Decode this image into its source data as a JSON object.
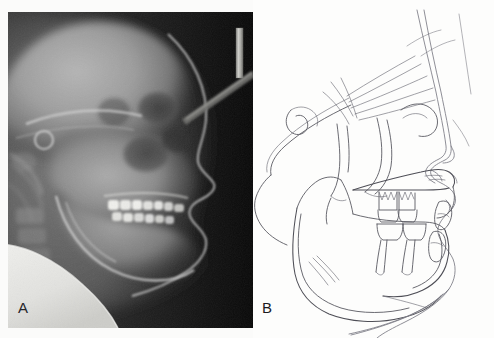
{
  "figure": {
    "panels": [
      {
        "letter": "A",
        "kind": "lateral-cephalometric-radiograph",
        "description": "Lateral cephalometric radiograph of the skull in profile"
      },
      {
        "letter": "B",
        "kind": "cephalometric-tracing",
        "description": "Hand-drawn cephalometric tracing of the same radiograph"
      }
    ]
  },
  "radiograph": {
    "background_color": "#0b0b0b",
    "bone_color": "#9a9a9a",
    "soft_tissue_color": "#5d5d5d",
    "enamel_color": "#f2f2f0",
    "shoulder_color": "#e9e9e6",
    "marker_color": "#cfcfcb",
    "structures": [
      "cranial vault",
      "frontal sinus",
      "orbit",
      "sella turcica",
      "maxillary sinus",
      "nasal cavity",
      "hard palate",
      "maxillary dentition",
      "mandibular dentition",
      "mandibular body",
      "mandibular ramus",
      "condyle",
      "cervical vertebrae",
      "soft tissue profile",
      "shoulder",
      "cephalostat rod"
    ]
  },
  "tracing": {
    "line_color": "#5a5a62",
    "soft_tissue_line_color": "#7b7b84",
    "background_color": "#fdfdfc",
    "structures": [
      "soft tissue profile",
      "forehead",
      "nasal dorsum",
      "nose tip",
      "upper lip",
      "lower lip",
      "chin",
      "submental contour",
      "anterior cranial base",
      "sella turcica",
      "clinoid process",
      "occipital outline",
      "pterygomaxillary fissure",
      "orbital rim",
      "maxilla",
      "hard palate",
      "anterior nasal spine",
      "posterior nasal spine",
      "maxillary first molar",
      "maxillary incisor",
      "mandibular first molar",
      "mandibular incisor",
      "mandibular symphysis",
      "mandibular body",
      "mandibular ramus",
      "gonial angle",
      "condyle",
      "coronoid process"
    ]
  }
}
